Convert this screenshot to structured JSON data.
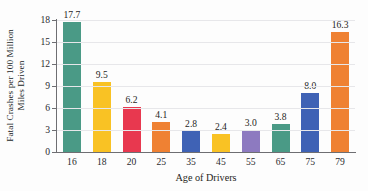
{
  "chart_data": {
    "type": "bar",
    "title": "",
    "xlabel": "Age of Drivers",
    "ylabel_line1": "Fatal Crashes per 100 Million",
    "ylabel_line2": "Miles Driven",
    "categories": [
      "16",
      "18",
      "20",
      "25",
      "35",
      "45",
      "55",
      "65",
      "75",
      "79"
    ],
    "values": [
      17.7,
      9.5,
      6.2,
      4.1,
      2.8,
      2.4,
      3.0,
      3.8,
      8.0,
      16.3
    ],
    "value_labels": [
      "17.7",
      "9.5",
      "6.2",
      "4.1",
      "2.8",
      "2.4",
      "3.0",
      "3.8",
      "8.0",
      "16.3"
    ],
    "bar_colors": [
      "#4a9a86",
      "#f9c224",
      "#e8384f",
      "#ef8133",
      "#3f62b5",
      "#f9c224",
      "#8d7ac0",
      "#4a9a86",
      "#3f62b5",
      "#ef8133"
    ],
    "ylim": [
      0,
      18
    ],
    "yticks": [
      0,
      3,
      6,
      9,
      12,
      15,
      18
    ],
    "ytick_labels": [
      "0",
      "3",
      "6",
      "9",
      "12",
      "15",
      "18"
    ],
    "grid": true,
    "legend": "none",
    "axis_color": "#6e6e72",
    "grid_color": "#e7e7ea",
    "background": "#fdfdfd"
  }
}
